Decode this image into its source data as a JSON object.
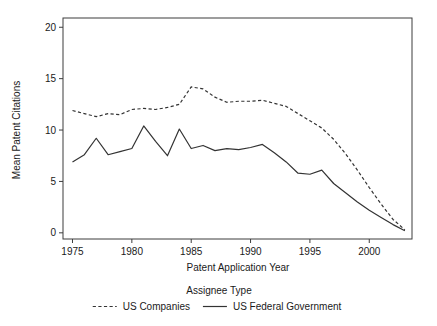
{
  "chart_data": {
    "type": "line",
    "title": "",
    "xlabel": "Patent Application Year",
    "ylabel": "Mean Patent Citations",
    "xlim": [
      1974.2,
      2003.6
    ],
    "ylim": [
      -0.6,
      20.9
    ],
    "xticks": [
      1975,
      1980,
      1985,
      1990,
      1995,
      2000
    ],
    "xtick_labels": [
      "1975",
      "1980",
      "1985",
      "1990",
      "1995",
      "2000"
    ],
    "yticks": [
      0,
      5,
      10,
      15,
      20
    ],
    "ytick_labels": [
      "0",
      "5",
      "10",
      "15",
      "20"
    ],
    "grid": false,
    "legend_position": "bottom",
    "legend_title": "Assignee Type",
    "x": [
      1975,
      1976,
      1977,
      1978,
      1979,
      1980,
      1981,
      1982,
      1983,
      1984,
      1985,
      1986,
      1987,
      1988,
      1989,
      1990,
      1991,
      1992,
      1993,
      1994,
      1995,
      1996,
      1997,
      1998,
      1999,
      2000,
      2001,
      2002,
      2003
    ],
    "series": [
      {
        "name": "US Companies",
        "style": "dashed",
        "color": "#333333",
        "values": [
          11.9,
          11.6,
          11.3,
          11.6,
          11.5,
          12.0,
          12.1,
          12.0,
          12.2,
          12.5,
          14.2,
          14.0,
          13.2,
          12.7,
          12.8,
          12.8,
          12.9,
          12.6,
          12.3,
          11.6,
          10.9,
          10.2,
          9.1,
          7.7,
          6.1,
          4.4,
          2.8,
          1.3,
          0.3
        ]
      },
      {
        "name": "US Federal Government",
        "style": "solid",
        "color": "#333333",
        "values": [
          6.9,
          7.6,
          9.2,
          7.6,
          7.9,
          8.2,
          10.4,
          8.9,
          7.5,
          10.1,
          8.2,
          8.5,
          8.0,
          8.2,
          8.1,
          8.3,
          8.6,
          7.8,
          6.9,
          5.8,
          5.7,
          6.1,
          4.8,
          3.9,
          3.0,
          2.2,
          1.5,
          0.8,
          0.2
        ]
      }
    ]
  },
  "legend": {
    "title": "Assignee Type",
    "entries": [
      {
        "label": "US Companies",
        "style": "dashed"
      },
      {
        "label": "US Federal Government",
        "style": "solid"
      }
    ]
  }
}
